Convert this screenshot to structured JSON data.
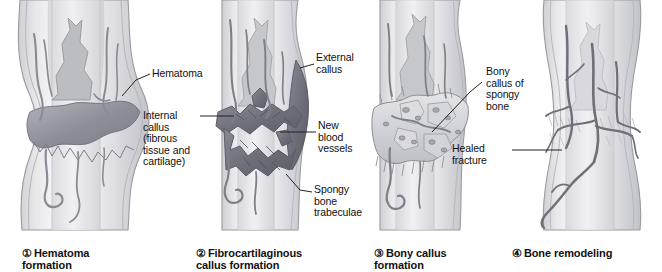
{
  "figure": {
    "background_color": "#ffffff",
    "ink_color": "#111111",
    "bone_fill": "#ededef",
    "bone_shade": "#c9c9cd",
    "bone_outline": "#8d8d93",
    "hematoma_color": "#9a9aa2",
    "callus_dark": "#6f6f78",
    "callus_light": "#d3d3d8",
    "vessel_color": "#76767f"
  },
  "panels": [
    {
      "number": "①",
      "caption": "Hematoma\nformation",
      "caption_line1": "Hematoma",
      "caption_line2": "formation",
      "labels": [
        {
          "text": "Hematoma",
          "name": "label-hematoma"
        }
      ]
    },
    {
      "number": "②",
      "caption": "Fibrocartilaginous\ncallus formation",
      "caption_line1": "Fibrocartilaginous",
      "caption_line2": "callus formation",
      "labels": [
        {
          "text": "External\ncallus",
          "name": "label-external-callus"
        },
        {
          "text": "Internal\ncallus\n(fibrous\ntissue and\ncartilage)",
          "name": "label-internal-callus"
        },
        {
          "text": "New\nblood\nvessels",
          "name": "label-new-blood-vessels"
        },
        {
          "text": "Spongy\nbone\ntrabeculae",
          "name": "label-spongy-bone-trabeculae"
        }
      ]
    },
    {
      "number": "③",
      "caption": "Bony callus\nformation",
      "caption_line1": "Bony callus",
      "caption_line2": "formation",
      "labels": [
        {
          "text": "Bony\ncallus of\nspongy\nbone",
          "name": "label-bony-callus-of-spongy-bone"
        }
      ]
    },
    {
      "number": "④",
      "caption": "Bone remodeling",
      "caption_line1": "Bone remodeling",
      "caption_line2": "",
      "labels": [
        {
          "text": "Healed\nfracture",
          "name": "label-healed-fracture"
        }
      ]
    }
  ]
}
